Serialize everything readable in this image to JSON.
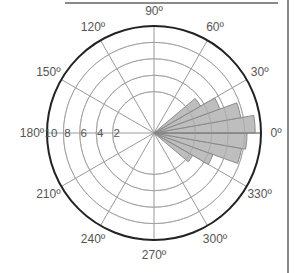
{
  "chart_data": {
    "type": "polar-rose",
    "title": "",
    "center": [
      154,
      133
    ],
    "outer_radius": 107,
    "radial_axis": {
      "tick_labels": [
        "2",
        "4",
        "6",
        "8",
        "10"
      ],
      "ticks": [
        2,
        4,
        6,
        8,
        10
      ],
      "range": [
        0,
        10
      ],
      "label_angle_deg": 180
    },
    "angular_axis": {
      "tick_labels": [
        "0º",
        "30º",
        "60º",
        "90º",
        "120º",
        "150º",
        "180º",
        "210º",
        "240º",
        "270º",
        "300º",
        "330º"
      ],
      "ticks_deg": [
        0,
        30,
        60,
        90,
        120,
        150,
        180,
        210,
        240,
        270,
        300,
        330
      ],
      "direction": "counterclockwise",
      "zero_at": "east"
    },
    "grid": true,
    "bin_width_deg": 10,
    "bins": [
      {
        "from_deg": 320,
        "to_deg": 330,
        "value": 2.4
      },
      {
        "from_deg": 330,
        "to_deg": 340,
        "value": 4.6
      },
      {
        "from_deg": 340,
        "to_deg": 350,
        "value": 7.8
      },
      {
        "from_deg": 350,
        "to_deg": 360,
        "value": 8.3
      },
      {
        "from_deg": 0,
        "to_deg": 10,
        "value": 9.3
      },
      {
        "from_deg": 10,
        "to_deg": 20,
        "value": 7.7
      },
      {
        "from_deg": 20,
        "to_deg": 30,
        "value": 5.5
      },
      {
        "from_deg": 30,
        "to_deg": 40,
        "value": 3.5
      }
    ],
    "colors": {
      "petal_fill": "#b3b3b3",
      "petal_stroke": "#8c8c8c",
      "grid": "#9a9a9a",
      "outer_circle": "#222222",
      "text": "#555555"
    }
  }
}
